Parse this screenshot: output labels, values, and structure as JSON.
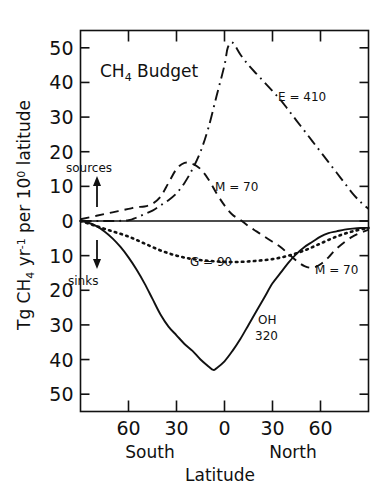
{
  "figure": {
    "title": "CH4 Budget",
    "title_parts": {
      "pre": "CH",
      "sub": "4",
      "post": " Budget"
    }
  },
  "axes": {
    "ylabel_parts": {
      "a": "Tg CH",
      "a_sub": "4",
      "b": " yr",
      "b_sup": "-1",
      "c": " per 10",
      "c_sup": "0",
      "d": " latitude"
    },
    "ylabel_plain": "Tg CH4 yr-1 per 10 0 latitude",
    "xlabel": "Latitude",
    "xlabel_left": "South",
    "xlabel_right": "North",
    "ytick_labels": [
      "50",
      "40",
      "30",
      "20",
      "10",
      "0",
      "10",
      "20",
      "30",
      "40",
      "50"
    ],
    "ytick_values": [
      50,
      40,
      30,
      20,
      10,
      0,
      -10,
      -20,
      -30,
      -40,
      -50
    ],
    "xtick_labels": [
      "60",
      "30",
      "0",
      "30",
      "60"
    ],
    "xtick_values": [
      -60,
      -30,
      0,
      30,
      60
    ]
  },
  "annotations": {
    "sources": "sources",
    "sinks": "sinks",
    "emission": "E = 410",
    "methane_left": "M = 70",
    "methane_right": "M = 70",
    "soil": "G = 90",
    "oh_name": "OH",
    "oh_value": "320"
  },
  "chart_data": {
    "type": "line",
    "title": "CH4 Budget",
    "xlabel": "Latitude",
    "ylabel": "Tg CH4 yr-1 per 10 deg latitude",
    "xlim": [
      -90,
      90
    ],
    "ylim": [
      -55,
      55
    ],
    "grid": false,
    "legend": "inline-annotations",
    "note": "Positive values are sources (upward), negative values are sinks (downward). Axis tick labels show absolute magnitudes on both halves.",
    "series": [
      {
        "name": "E = 410",
        "label": "E = 410",
        "total": 410,
        "style": "dash-dot",
        "kind": "source",
        "x": [
          -90,
          -80,
          -70,
          -60,
          -55,
          -50,
          -45,
          -40,
          -35,
          -30,
          -25,
          -20,
          -15,
          -10,
          -5,
          0,
          2,
          5,
          10,
          15,
          20,
          25,
          30,
          35,
          40,
          45,
          50,
          55,
          60,
          65,
          70,
          75,
          80,
          85,
          90
        ],
        "y": [
          0,
          0,
          0,
          0.2,
          1.0,
          2.0,
          3.0,
          4.5,
          6.0,
          8.0,
          11.0,
          15.0,
          20.0,
          27.0,
          36.0,
          45.0,
          50.0,
          51.5,
          48.0,
          45.0,
          42.5,
          40.0,
          37.5,
          35.0,
          32.0,
          29.0,
          26.0,
          23.0,
          20.0,
          17.0,
          14.0,
          11.0,
          8.0,
          5.5,
          3.5
        ]
      },
      {
        "name": "M = 70 (source)",
        "label": "M = 70",
        "total": 70,
        "style": "dashed",
        "kind": "source",
        "x": [
          -90,
          -80,
          -70,
          -60,
          -55,
          -50,
          -45,
          -40,
          -35,
          -30,
          -25,
          -20,
          -15,
          -10,
          -5,
          0,
          5,
          10,
          15,
          20,
          25,
          30,
          35,
          40,
          45,
          50,
          55,
          60,
          65,
          70,
          80,
          90
        ],
        "y": [
          0.5,
          1.5,
          2.5,
          3.5,
          4.0,
          4.2,
          5.0,
          7.0,
          11.0,
          15.0,
          16.8,
          16.5,
          15.0,
          12.0,
          8.0,
          4.5,
          1.8,
          0.3,
          -1.5,
          -3.0,
          -4.5,
          -6.0,
          -7.5,
          -9.5,
          -11.5,
          -13.0,
          -13.5,
          -12.5,
          -10.5,
          -8.0,
          -4.5,
          -2.5
        ]
      },
      {
        "name": "G = 90",
        "label": "G = 90",
        "total": 90,
        "style": "dotted",
        "kind": "sink",
        "x": [
          -90,
          -80,
          -70,
          -60,
          -50,
          -40,
          -30,
          -20,
          -10,
          0,
          10,
          20,
          30,
          40,
          50,
          60,
          70,
          80,
          90
        ],
        "y": [
          0,
          -1.5,
          -3.0,
          -4.5,
          -6.5,
          -8.5,
          -10.0,
          -11.0,
          -11.5,
          -11.8,
          -11.8,
          -11.5,
          -11.0,
          -10.0,
          -8.5,
          -6.5,
          -4.5,
          -3.0,
          -2.0
        ]
      },
      {
        "name": "OH 320",
        "label": "OH 320",
        "total": 320,
        "style": "solid",
        "kind": "sink",
        "x": [
          -90,
          -85,
          -80,
          -75,
          -70,
          -65,
          -60,
          -55,
          -50,
          -45,
          -40,
          -35,
          -30,
          -25,
          -20,
          -15,
          -10,
          -7,
          -5,
          0,
          5,
          10,
          15,
          20,
          25,
          30,
          35,
          40,
          45,
          50,
          55,
          60,
          65,
          70,
          75,
          80,
          85,
          90
        ],
        "y": [
          0,
          -0.5,
          -1.5,
          -3.0,
          -5.0,
          -7.5,
          -10.5,
          -14.0,
          -18.0,
          -22.5,
          -27.0,
          -30.5,
          -33.0,
          -35.5,
          -37.5,
          -40.0,
          -42.0,
          -43.0,
          -42.5,
          -40.5,
          -37.5,
          -34.0,
          -30.0,
          -26.0,
          -22.0,
          -18.0,
          -15.0,
          -12.0,
          -9.5,
          -7.5,
          -6.0,
          -4.5,
          -3.5,
          -3.0,
          -2.5,
          -2.2,
          -2.0,
          -2.0
        ]
      }
    ]
  }
}
